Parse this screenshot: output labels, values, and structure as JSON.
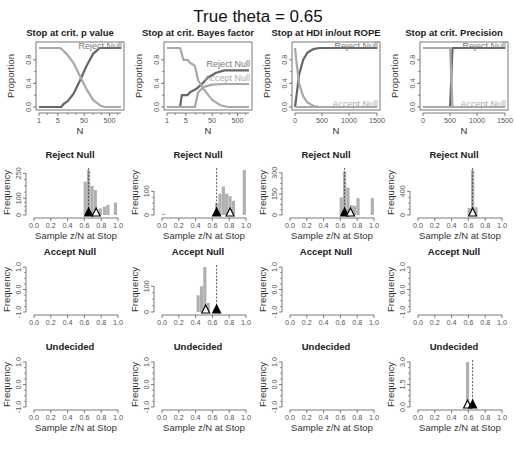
{
  "figure": {
    "title": "True theta = 0.65",
    "caption": "... the ... of ... of sample ... for theta = 0.65. The top row ..."
  },
  "colors": {
    "reject": "#666666",
    "accept": "#a8a8a8",
    "bar": "#b0b0b0",
    "axis": "#444444",
    "frame": "#555555",
    "triangle": "#000000"
  },
  "chart_data": [
    {
      "id": "p-value-proportion",
      "type": "line",
      "title": "Stop at crit. p value",
      "xlabel": "N",
      "ylabel": "Proportion",
      "xscale": "log",
      "xticks": [
        "1",
        "5",
        "50",
        "500"
      ],
      "yticks": [
        "0.0",
        "0.4",
        "0.8"
      ],
      "ylim": [
        0,
        1
      ],
      "legend": [
        "Reject Null"
      ],
      "series": [
        {
          "name": "Reject Null",
          "points": [
            [
              0,
              0
            ],
            [
              0.27,
              0
            ],
            [
              0.3,
              0.05
            ],
            [
              0.35,
              0.1
            ],
            [
              0.42,
              0.22
            ],
            [
              0.5,
              0.45
            ],
            [
              0.58,
              0.7
            ],
            [
              0.66,
              0.9
            ],
            [
              0.74,
              1
            ],
            [
              1,
              1
            ]
          ]
        },
        {
          "name": "Undecided",
          "points": [
            [
              0,
              1
            ],
            [
              0.26,
              1
            ],
            [
              0.3,
              0.95
            ],
            [
              0.35,
              0.88
            ],
            [
              0.42,
              0.75
            ],
            [
              0.5,
              0.52
            ],
            [
              0.58,
              0.3
            ],
            [
              0.66,
              0.12
            ],
            [
              0.74,
              0.03
            ],
            [
              0.8,
              0
            ],
            [
              1,
              0
            ]
          ]
        }
      ]
    },
    {
      "id": "bayes-factor-proportion",
      "type": "line",
      "title": "Stop at crit. Bayes factor",
      "xlabel": "N",
      "ylabel": "Proportion",
      "xscale": "log",
      "xticks": [
        "1",
        "5",
        "50",
        "500"
      ],
      "yticks": [
        "0.0",
        "0.4",
        "0.8"
      ],
      "ylim": [
        0,
        1
      ],
      "legend": [
        "Reject Null",
        "Accept Null"
      ],
      "series": [
        {
          "name": "Reject Null",
          "points": [
            [
              0,
              0
            ],
            [
              0.16,
              0
            ],
            [
              0.18,
              0.2
            ],
            [
              0.25,
              0.2
            ],
            [
              0.28,
              0.25
            ],
            [
              0.35,
              0.3
            ],
            [
              0.42,
              0.38
            ],
            [
              0.5,
              0.5
            ],
            [
              0.6,
              0.58
            ],
            [
              0.7,
              0.62
            ],
            [
              1,
              0.62
            ]
          ]
        },
        {
          "name": "Accept Null",
          "points": [
            [
              0,
              0
            ],
            [
              0.34,
              0
            ],
            [
              0.38,
              0.25
            ],
            [
              0.45,
              0.34
            ],
            [
              0.55,
              0.38
            ],
            [
              0.7,
              0.39
            ],
            [
              1,
              0.39
            ]
          ]
        },
        {
          "name": "Undecided",
          "points": [
            [
              0,
              1
            ],
            [
              0.16,
              1
            ],
            [
              0.2,
              0.8
            ],
            [
              0.25,
              0.8
            ],
            [
              0.28,
              0.75
            ],
            [
              0.34,
              0.7
            ],
            [
              0.38,
              0.45
            ],
            [
              0.45,
              0.3
            ],
            [
              0.55,
              0.12
            ],
            [
              0.65,
              0.03
            ],
            [
              0.75,
              0
            ],
            [
              1,
              0
            ]
          ]
        }
      ]
    },
    {
      "id": "hdi-rope-proportion",
      "type": "line",
      "title": "Stop at HDI in/out ROPE",
      "xlabel": "N",
      "ylabel": "Proportion",
      "xscale": "linear",
      "xticks": [
        "0",
        "500",
        "1000",
        "1500"
      ],
      "yticks": [
        "0.0",
        "0.4",
        "0.8"
      ],
      "ylim": [
        0,
        1
      ],
      "legend": [
        "Reject Null",
        "Accept Null"
      ],
      "series": [
        {
          "name": "Reject Null",
          "points": [
            [
              0,
              0
            ],
            [
              0.02,
              0.2
            ],
            [
              0.05,
              0.55
            ],
            [
              0.1,
              0.8
            ],
            [
              0.15,
              0.92
            ],
            [
              0.22,
              0.98
            ],
            [
              0.3,
              1
            ],
            [
              1,
              1
            ]
          ]
        },
        {
          "name": "Accept Null",
          "points": [
            [
              0,
              0
            ],
            [
              1,
              0
            ]
          ]
        },
        {
          "name": "Undecided",
          "points": [
            [
              0,
              1
            ],
            [
              0.02,
              0.75
            ],
            [
              0.05,
              0.4
            ],
            [
              0.1,
              0.18
            ],
            [
              0.15,
              0.08
            ],
            [
              0.22,
              0.02
            ],
            [
              0.3,
              0
            ],
            [
              1,
              0
            ]
          ]
        }
      ]
    },
    {
      "id": "precision-proportion",
      "type": "line",
      "title": "Stop at crit. Precision",
      "xlabel": "N",
      "ylabel": "Proportion",
      "xscale": "linear",
      "xticks": [
        "0",
        "500",
        "1000",
        "1500"
      ],
      "yticks": [
        "0.0",
        "0.4",
        "0.8"
      ],
      "ylim": [
        0,
        1
      ],
      "legend": [
        "Reject Null",
        "Accept Null"
      ],
      "series": [
        {
          "name": "Reject Null",
          "points": [
            [
              0,
              0
            ],
            [
              0.33,
              0
            ],
            [
              0.345,
              0.5
            ],
            [
              0.36,
              1
            ],
            [
              1,
              1
            ]
          ]
        },
        {
          "name": "Accept Null",
          "points": [
            [
              0,
              0
            ],
            [
              1,
              0
            ]
          ]
        },
        {
          "name": "Undecided",
          "points": [
            [
              0,
              1
            ],
            [
              0.33,
              1
            ],
            [
              0.345,
              0.5
            ],
            [
              0.36,
              0
            ],
            [
              1,
              0
            ]
          ]
        }
      ]
    },
    {
      "id": "p-value-reject-hist",
      "type": "bar",
      "title": "Reject Null",
      "xlabel": "Sample z/N at Stop",
      "ylabel": "Frequency",
      "xticks": [
        "0.0",
        "0.2",
        "0.4",
        "0.6",
        "0.8",
        "1.0"
      ],
      "yticks": [
        "0",
        "100",
        "250"
      ],
      "ylim": [
        0,
        270
      ],
      "bars": [
        [
          0.61,
          200
        ],
        [
          0.65,
          270
        ],
        [
          0.69,
          175
        ],
        [
          0.73,
          150
        ],
        [
          0.79,
          40
        ],
        [
          0.84,
          50
        ],
        [
          0.88,
          60
        ],
        [
          0.97,
          75
        ]
      ],
      "dashed_x": 0.65,
      "triangles": [
        {
          "x": 0.65,
          "filled": true
        },
        {
          "x": 0.74,
          "filled": false
        }
      ]
    },
    {
      "id": "bayes-reject-hist",
      "type": "bar",
      "title": "Reject Null",
      "xlabel": "Sample z/N at Stop",
      "ylabel": "Frequency",
      "xticks": [
        "0.0",
        "0.2",
        "0.4",
        "0.6",
        "0.8",
        "1.0"
      ],
      "yticks": [
        "0",
        "100"
      ],
      "ylim": [
        0,
        190
      ],
      "bars": [
        [
          0.02,
          5
        ],
        [
          0.65,
          50
        ],
        [
          0.69,
          90
        ],
        [
          0.73,
          120
        ],
        [
          0.77,
          90
        ],
        [
          0.81,
          80
        ],
        [
          0.85,
          60
        ],
        [
          0.98,
          190
        ]
      ],
      "dashed_x": 0.65,
      "triangles": [
        {
          "x": 0.65,
          "filled": true
        },
        {
          "x": 0.81,
          "filled": false
        }
      ]
    },
    {
      "id": "hdi-reject-hist",
      "type": "bar",
      "title": "Reject Null",
      "xlabel": "Sample z/N at Stop",
      "ylabel": "Frequency",
      "xticks": [
        "0.0",
        "0.2",
        "0.4",
        "0.6",
        "0.8",
        "1.0"
      ],
      "yticks": [
        "0",
        "150",
        "300"
      ],
      "ylim": [
        0,
        320
      ],
      "bars": [
        [
          0.61,
          125
        ],
        [
          0.65,
          310
        ],
        [
          0.69,
          195
        ],
        [
          0.73,
          70
        ],
        [
          0.77,
          65
        ],
        [
          0.81,
          120
        ],
        [
          0.98,
          120
        ]
      ],
      "dashed_x": 0.65,
      "triangles": [
        {
          "x": 0.65,
          "filled": true
        },
        {
          "x": 0.72,
          "filled": false
        }
      ]
    },
    {
      "id": "precision-reject-hist",
      "type": "bar",
      "title": "Reject Null",
      "xlabel": "Sample z/N at Stop",
      "ylabel": "Frequency",
      "xticks": [
        "0.0",
        "0.2",
        "0.4",
        "0.6",
        "0.8",
        "1.0"
      ],
      "yticks": [
        "0",
        "400"
      ],
      "ylim": [
        0,
        760
      ],
      "bars": [
        [
          0.61,
          120
        ],
        [
          0.65,
          760
        ],
        [
          0.69,
          130
        ]
      ],
      "dashed_x": 0.65,
      "triangles": [
        {
          "x": 0.65,
          "filled": false
        }
      ]
    },
    {
      "id": "p-value-accept-hist",
      "type": "bar",
      "title": "Accept Null",
      "xlabel": "",
      "ylabel": "Frequency",
      "xticks": [
        "0.0",
        "0.2",
        "0.4",
        "0.6",
        "0.8",
        "1.0"
      ],
      "yticks": [
        "-1.0",
        "0.0",
        "1.0"
      ],
      "ylim": [
        -1,
        1
      ],
      "bars": []
    },
    {
      "id": "bayes-accept-hist",
      "type": "bar",
      "title": "Accept Null",
      "xlabel": "",
      "ylabel": "Frequency",
      "xticks": [
        "0.0",
        "0.2",
        "0.4",
        "0.6",
        "0.8",
        "1.0"
      ],
      "yticks": [
        "0",
        "100"
      ],
      "ylim": [
        0,
        175
      ],
      "bars": [
        [
          0.43,
          65
        ],
        [
          0.47,
          100
        ],
        [
          0.51,
          175
        ],
        [
          0.55,
          35
        ]
      ],
      "dashed_x": 0.65,
      "triangles": [
        {
          "x": 0.52,
          "filled": false
        },
        {
          "x": 0.65,
          "filled": true
        }
      ]
    },
    {
      "id": "hdi-accept-hist",
      "type": "bar",
      "title": "Accept Null",
      "xlabel": "",
      "ylabel": "Frequency",
      "xticks": [
        "0.0",
        "0.2",
        "0.4",
        "0.6",
        "0.8",
        "1.0"
      ],
      "yticks": [
        "-1.0",
        "0.0",
        "1.0"
      ],
      "ylim": [
        -1,
        1
      ],
      "bars": []
    },
    {
      "id": "precision-accept-hist",
      "type": "bar",
      "title": "Accept Null",
      "xlabel": "",
      "ylabel": "Frequency",
      "xticks": [
        "0.0",
        "0.2",
        "0.4",
        "0.6",
        "0.8",
        "1.0"
      ],
      "yticks": [
        "-1.0",
        "0.0",
        "1.0"
      ],
      "ylim": [
        -1,
        1
      ],
      "bars": []
    },
    {
      "id": "p-value-undecided-hist",
      "type": "bar",
      "title": "Undecided",
      "xlabel": "Sample z/N at Stop",
      "ylabel": "Frequency",
      "xticks": [
        "0.0",
        "0.2",
        "0.4",
        "0.6",
        "0.8",
        "1.0"
      ],
      "yticks": [
        "-1.0",
        "0.0",
        "1.0"
      ],
      "ylim": [
        -1,
        1
      ],
      "bars": []
    },
    {
      "id": "bayes-undecided-hist",
      "type": "bar",
      "title": "Undecided",
      "xlabel": "Sample z/N at Stop",
      "ylabel": "Frequency",
      "xticks": [
        "0.0",
        "0.2",
        "0.4",
        "0.6",
        "0.8",
        "1.0"
      ],
      "yticks": [
        "-1.0",
        "0.0",
        "1.0"
      ],
      "ylim": [
        -1,
        1
      ],
      "bars": []
    },
    {
      "id": "hdi-undecided-hist",
      "type": "bar",
      "title": "Undecided",
      "xlabel": "Sample z/N at Stop",
      "ylabel": "Frequency",
      "xticks": [
        "0.0",
        "0.2",
        "0.4",
        "0.6",
        "0.8",
        "1.0"
      ],
      "yticks": [
        "-1.0",
        "0.0",
        "1.0"
      ],
      "ylim": [
        -1,
        1
      ],
      "bars": []
    },
    {
      "id": "precision-undecided-hist",
      "type": "bar",
      "title": "Undecided",
      "xlabel": "Sample z/N at Stop",
      "ylabel": "Frequency",
      "xticks": [
        "0.0",
        "0.2",
        "0.4",
        "0.6",
        "0.8",
        "1.0"
      ],
      "yticks": [
        "0.0",
        "1.5",
        "3.0"
      ],
      "ylim": [
        0,
        3
      ],
      "bars": [
        [
          0.59,
          3
        ]
      ],
      "dashed_x": 0.65,
      "triangles": [
        {
          "x": 0.59,
          "filled": false
        },
        {
          "x": 0.65,
          "filled": true
        }
      ]
    }
  ]
}
